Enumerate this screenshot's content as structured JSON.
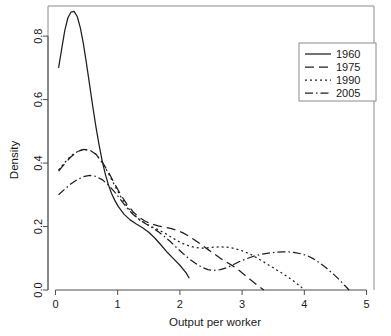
{
  "chart_data": {
    "type": "line",
    "title": "",
    "subtitle": "",
    "xlabel": "Output per worker",
    "ylabel": "Density",
    "xlim": [
      -0.12,
      5.12
    ],
    "ylim": [
      0.0,
      0.895
    ],
    "xticks": [
      0,
      1,
      2,
      3,
      4,
      5
    ],
    "xtick_labels": [
      "0",
      "1",
      "2",
      "3",
      "4",
      "5"
    ],
    "yticks": [
      0.0,
      0.2,
      0.4,
      0.6,
      0.8
    ],
    "ytick_labels": [
      "0.0",
      "0.2",
      "0.4",
      "0.6",
      "0.8"
    ],
    "grid": false,
    "frame": true,
    "legend_position": "top-right",
    "legend_entries": [
      "1960",
      "1975",
      "1990",
      "2005"
    ],
    "annotations": [],
    "series": [
      {
        "name": "1960",
        "linestyle": "solid",
        "dash": "none",
        "color": "#1f1f1f",
        "x": [
          0.05,
          0.1,
          0.15,
          0.2,
          0.25,
          0.3,
          0.35,
          0.4,
          0.45,
          0.5,
          0.55,
          0.6,
          0.65,
          0.7,
          0.75,
          0.8,
          0.85,
          0.9,
          0.95,
          1.0,
          1.1,
          1.2,
          1.3,
          1.4,
          1.5,
          1.6,
          1.7,
          1.8,
          1.9,
          2.0,
          2.1,
          2.15
        ],
        "y": [
          0.7,
          0.76,
          0.818,
          0.858,
          0.876,
          0.878,
          0.862,
          0.826,
          0.775,
          0.712,
          0.645,
          0.578,
          0.515,
          0.458,
          0.408,
          0.366,
          0.332,
          0.305,
          0.284,
          0.266,
          0.239,
          0.221,
          0.208,
          0.196,
          0.182,
          0.163,
          0.141,
          0.118,
          0.098,
          0.078,
          0.054,
          0.037
        ]
      },
      {
        "name": "1975",
        "linestyle": "dashed",
        "dash": "9,5",
        "color": "#1f1f1f",
        "x": [
          0.05,
          0.15,
          0.25,
          0.35,
          0.45,
          0.55,
          0.65,
          0.75,
          0.85,
          0.95,
          1.05,
          1.15,
          1.25,
          1.35,
          1.45,
          1.55,
          1.65,
          1.75,
          1.85,
          1.95,
          2.05,
          2.15,
          2.25,
          2.35,
          2.45,
          2.55,
          2.65,
          2.75,
          2.85,
          2.95,
          3.05,
          3.15,
          3.25,
          3.35
        ],
        "y": [
          0.375,
          0.398,
          0.42,
          0.436,
          0.443,
          0.441,
          0.428,
          0.404,
          0.372,
          0.335,
          0.3,
          0.27,
          0.246,
          0.228,
          0.216,
          0.208,
          0.202,
          0.198,
          0.194,
          0.188,
          0.18,
          0.169,
          0.156,
          0.142,
          0.128,
          0.114,
          0.1,
          0.088,
          0.076,
          0.062,
          0.046,
          0.03,
          0.014,
          0.0
        ]
      },
      {
        "name": "1990",
        "linestyle": "dotted",
        "dash": "2,3",
        "color": "#1f1f1f",
        "x": [
          0.05,
          0.15,
          0.25,
          0.35,
          0.45,
          0.55,
          0.65,
          0.75,
          0.85,
          0.95,
          1.05,
          1.15,
          1.25,
          1.35,
          1.45,
          1.55,
          1.65,
          1.75,
          1.85,
          1.95,
          2.05,
          2.15,
          2.25,
          2.35,
          2.45,
          2.55,
          2.65,
          2.75,
          2.85,
          2.95,
          3.05,
          3.15,
          3.25,
          3.35,
          3.45,
          3.55,
          3.65,
          3.75,
          3.85,
          3.95,
          4.0
        ],
        "y": [
          0.378,
          0.402,
          0.423,
          0.436,
          0.443,
          0.441,
          0.428,
          0.402,
          0.368,
          0.33,
          0.294,
          0.263,
          0.239,
          0.221,
          0.209,
          0.199,
          0.19,
          0.18,
          0.168,
          0.156,
          0.146,
          0.139,
          0.134,
          0.132,
          0.133,
          0.135,
          0.136,
          0.135,
          0.132,
          0.127,
          0.12,
          0.111,
          0.1,
          0.088,
          0.076,
          0.064,
          0.052,
          0.039,
          0.025,
          0.009,
          0.0
        ]
      },
      {
        "name": "2005",
        "linestyle": "dashdot",
        "dash": "8,3,1.5,3",
        "color": "#1f1f1f",
        "x": [
          0.05,
          0.15,
          0.25,
          0.35,
          0.45,
          0.55,
          0.65,
          0.75,
          0.85,
          0.95,
          1.05,
          1.15,
          1.25,
          1.35,
          1.45,
          1.55,
          1.65,
          1.75,
          1.85,
          1.95,
          2.05,
          2.15,
          2.25,
          2.35,
          2.45,
          2.55,
          2.65,
          2.75,
          2.85,
          2.95,
          3.05,
          3.15,
          3.25,
          3.35,
          3.45,
          3.55,
          3.65,
          3.75,
          3.85,
          3.95,
          4.05,
          4.15,
          4.25,
          4.35,
          4.45,
          4.55,
          4.65,
          4.72
        ],
        "y": [
          0.3,
          0.318,
          0.335,
          0.348,
          0.357,
          0.361,
          0.358,
          0.348,
          0.331,
          0.309,
          0.284,
          0.259,
          0.238,
          0.222,
          0.209,
          0.197,
          0.184,
          0.169,
          0.152,
          0.133,
          0.115,
          0.098,
          0.084,
          0.072,
          0.064,
          0.062,
          0.064,
          0.07,
          0.079,
          0.089,
          0.097,
          0.104,
          0.11,
          0.114,
          0.117,
          0.119,
          0.12,
          0.12,
          0.118,
          0.114,
          0.108,
          0.098,
          0.085,
          0.07,
          0.053,
          0.035,
          0.014,
          0.0
        ]
      }
    ]
  },
  "legend": {
    "items": [
      {
        "label": "1960",
        "style": "solid"
      },
      {
        "label": "1975",
        "style": "dashed"
      },
      {
        "label": "1990",
        "style": "dotted"
      },
      {
        "label": "2005",
        "style": "dashdot"
      }
    ]
  }
}
